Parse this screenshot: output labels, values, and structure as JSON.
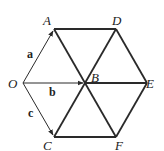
{
  "diagram": {
    "type": "regular hexagon with vectors",
    "points": {
      "O": {
        "label": "O",
        "x": 23,
        "y": 83
      },
      "A": {
        "label": "A",
        "x": 54,
        "y": 29
      },
      "D": {
        "label": "D",
        "x": 116,
        "y": 29
      },
      "B": {
        "label": "B",
        "x": 85,
        "y": 83
      },
      "E": {
        "label": "E",
        "x": 147,
        "y": 83
      },
      "C": {
        "label": "C",
        "x": 54,
        "y": 137
      },
      "F": {
        "label": "F",
        "x": 116,
        "y": 137
      }
    },
    "vectors": [
      {
        "name": "a",
        "label": "a",
        "from": "O",
        "to": "A"
      },
      {
        "name": "b",
        "label": "b",
        "from": "O",
        "to": "B"
      },
      {
        "name": "c",
        "label": "c",
        "from": "O",
        "to": "C"
      }
    ],
    "segments": [
      [
        "A",
        "D"
      ],
      [
        "D",
        "E"
      ],
      [
        "E",
        "F"
      ],
      [
        "F",
        "C"
      ],
      [
        "A",
        "B"
      ],
      [
        "B",
        "F"
      ],
      [
        "D",
        "B"
      ],
      [
        "B",
        "C"
      ],
      [
        "B",
        "E"
      ]
    ],
    "colors": {
      "line": "#2a2a2a",
      "text": "#222222",
      "background": "#ffffff"
    }
  }
}
